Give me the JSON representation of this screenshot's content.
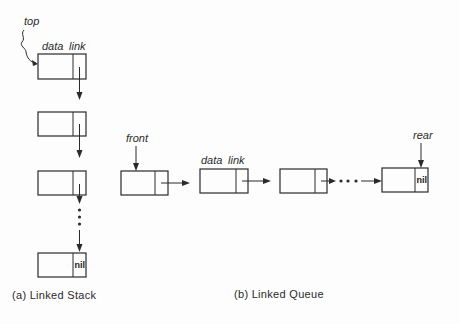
{
  "diagram": {
    "type": "linked-data-structures",
    "stack": {
      "pointer_label": "top",
      "field_labels": {
        "data": "data",
        "link": "link"
      },
      "nodes": [
        {
          "data": "",
          "link": ""
        },
        {
          "data": "",
          "link": ""
        },
        {
          "data": "",
          "link": ""
        },
        {
          "data": "",
          "link": "nil"
        }
      ],
      "ellipsis": "...",
      "caption": "(a)  Linked  Stack"
    },
    "queue": {
      "front_label": "front",
      "rear_label": "rear",
      "field_labels": {
        "data": "data",
        "link": "link"
      },
      "nodes": [
        {
          "data": "",
          "link": ""
        },
        {
          "data": "",
          "link": ""
        },
        {
          "data": "",
          "link": ""
        },
        {
          "data": "",
          "link": "nil"
        }
      ],
      "ellipsis": "...",
      "caption": "(b)  Linked  Queue"
    },
    "colors": {
      "ink": "#2a2a2a",
      "paper": "#fdfdfd"
    }
  }
}
